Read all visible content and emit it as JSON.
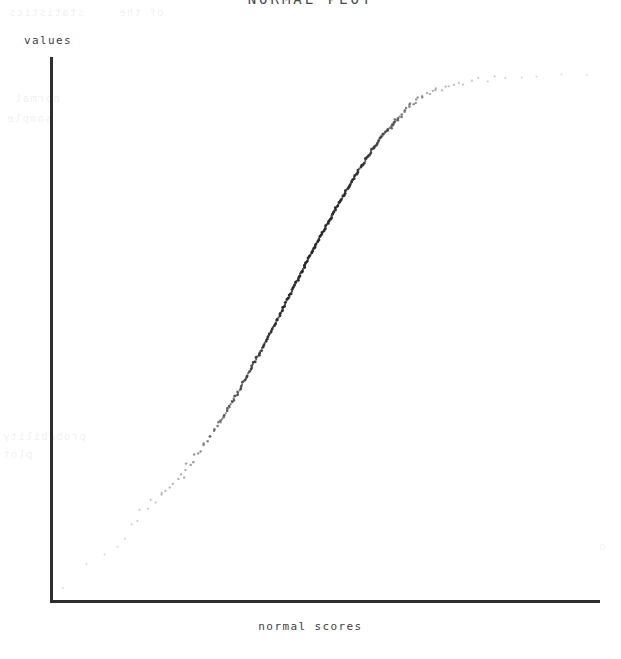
{
  "title": "NORMAL PLOT",
  "axes": {
    "y_label": "values",
    "x_label": "normal scores"
  },
  "ghost_text": [
    {
      "text": "statistics",
      "x": 8,
      "y": 6
    },
    {
      "text": "of the",
      "x": 118,
      "y": 6
    },
    {
      "text": "normal",
      "x": 14,
      "y": 92
    },
    {
      "text": "sample",
      "x": 6,
      "y": 112
    },
    {
      "text": "probability",
      "x": 2,
      "y": 430
    },
    {
      "text": "plot",
      "x": 2,
      "y": 448
    },
    {
      "text": "o",
      "x": 598,
      "y": 540
    }
  ],
  "chart_data": {
    "type": "scatter",
    "title": "NORMAL PLOT",
    "xlabel": "normal scores",
    "ylabel": "values",
    "grid": false,
    "legend": null,
    "axis_style": "L-shaped spines, no tick marks, no tick labels",
    "xlim": [
      -3,
      3
    ],
    "ylim": [
      0,
      1
    ],
    "n_points": 200,
    "x": [
      -2.88,
      -2.62,
      -2.41,
      -2.3,
      -2.2,
      -2.14,
      -2.07,
      -2.02,
      -1.96,
      -1.91,
      -1.86,
      -1.82,
      -1.78,
      -1.74,
      -1.7,
      -1.66,
      -1.63,
      -1.6,
      -1.57,
      -1.54,
      -1.51,
      -1.48,
      -1.45,
      -1.42,
      -1.4,
      -1.37,
      -1.35,
      -1.32,
      -1.3,
      -1.27,
      -1.25,
      -1.23,
      -1.21,
      -1.19,
      -1.16,
      -1.14,
      -1.12,
      -1.1,
      -1.08,
      -1.06,
      -1.04,
      -1.03,
      -1.01,
      -0.99,
      -0.97,
      -0.95,
      -0.93,
      -0.92,
      -0.9,
      -0.88,
      -0.86,
      -0.85,
      -0.83,
      -0.81,
      -0.8,
      -0.78,
      -0.76,
      -0.75,
      -0.73,
      -0.72,
      -0.7,
      -0.68,
      -0.67,
      -0.65,
      -0.64,
      -0.62,
      -0.61,
      -0.59,
      -0.58,
      -0.56,
      -0.55,
      -0.53,
      -0.52,
      -0.5,
      -0.49,
      -0.47,
      -0.46,
      -0.45,
      -0.43,
      -0.42,
      -0.4,
      -0.39,
      -0.37,
      -0.36,
      -0.35,
      -0.33,
      -0.32,
      -0.3,
      -0.29,
      -0.28,
      -0.26,
      -0.25,
      -0.23,
      -0.22,
      -0.21,
      -0.19,
      -0.18,
      -0.17,
      -0.15,
      -0.14,
      -0.12,
      -0.11,
      -0.1,
      -0.08,
      -0.07,
      -0.06,
      -0.04,
      -0.03,
      -0.01,
      0.0,
      0.01,
      0.03,
      0.04,
      0.06,
      0.07,
      0.08,
      0.1,
      0.11,
      0.12,
      0.14,
      0.15,
      0.17,
      0.18,
      0.19,
      0.21,
      0.22,
      0.23,
      0.25,
      0.26,
      0.28,
      0.29,
      0.3,
      0.32,
      0.33,
      0.35,
      0.36,
      0.37,
      0.39,
      0.4,
      0.42,
      0.43,
      0.45,
      0.46,
      0.47,
      0.49,
      0.5,
      0.52,
      0.53,
      0.55,
      0.56,
      0.58,
      0.59,
      0.61,
      0.62,
      0.64,
      0.65,
      0.67,
      0.68,
      0.7,
      0.72,
      0.73,
      0.75,
      0.76,
      0.78,
      0.8,
      0.81,
      0.83,
      0.85,
      0.86,
      0.88,
      0.9,
      0.92,
      0.93,
      0.95,
      0.97,
      0.99,
      1.01,
      1.03,
      1.06,
      1.08,
      1.1,
      1.14,
      1.17,
      1.2,
      1.24,
      1.28,
      1.32,
      1.37,
      1.42,
      1.48,
      1.54,
      1.61,
      1.69,
      1.78,
      1.88,
      2.0,
      2.15,
      2.35,
      2.6,
      2.9
    ],
    "y": [
      0.028,
      0.07,
      0.082,
      0.104,
      0.119,
      0.144,
      0.151,
      0.163,
      0.168,
      0.183,
      0.183,
      0.197,
      0.194,
      0.207,
      0.213,
      0.219,
      0.222,
      0.234,
      0.231,
      0.243,
      0.25,
      0.253,
      0.259,
      0.268,
      0.271,
      0.278,
      0.287,
      0.29,
      0.296,
      0.302,
      0.305,
      0.314,
      0.317,
      0.323,
      0.329,
      0.332,
      0.341,
      0.344,
      0.351,
      0.356,
      0.359,
      0.368,
      0.371,
      0.378,
      0.381,
      0.387,
      0.393,
      0.396,
      0.405,
      0.408,
      0.414,
      0.417,
      0.426,
      0.429,
      0.435,
      0.441,
      0.444,
      0.45,
      0.456,
      0.459,
      0.465,
      0.471,
      0.474,
      0.48,
      0.486,
      0.489,
      0.495,
      0.498,
      0.504,
      0.51,
      0.513,
      0.519,
      0.522,
      0.528,
      0.534,
      0.537,
      0.543,
      0.546,
      0.552,
      0.558,
      0.561,
      0.567,
      0.57,
      0.576,
      0.582,
      0.585,
      0.591,
      0.594,
      0.6,
      0.603,
      0.609,
      0.612,
      0.618,
      0.621,
      0.627,
      0.63,
      0.636,
      0.639,
      0.645,
      0.648,
      0.654,
      0.657,
      0.66,
      0.666,
      0.669,
      0.675,
      0.678,
      0.684,
      0.687,
      0.69,
      0.696,
      0.699,
      0.705,
      0.708,
      0.711,
      0.717,
      0.72,
      0.726,
      0.729,
      0.732,
      0.738,
      0.741,
      0.744,
      0.75,
      0.753,
      0.756,
      0.762,
      0.765,
      0.768,
      0.771,
      0.777,
      0.78,
      0.783,
      0.789,
      0.792,
      0.795,
      0.798,
      0.804,
      0.807,
      0.81,
      0.813,
      0.819,
      0.822,
      0.825,
      0.828,
      0.831,
      0.837,
      0.84,
      0.843,
      0.846,
      0.849,
      0.852,
      0.858,
      0.861,
      0.864,
      0.867,
      0.87,
      0.873,
      0.876,
      0.879,
      0.882,
      0.885,
      0.888,
      0.891,
      0.894,
      0.897,
      0.9,
      0.903,
      0.906,
      0.909,
      0.912,
      0.915,
      0.918,
      0.921,
      0.923,
      0.926,
      0.929,
      0.932,
      0.934,
      0.937,
      0.939,
      0.942,
      0.944,
      0.947,
      0.949,
      0.951,
      0.954,
      0.956,
      0.958,
      0.96,
      0.962,
      0.964,
      0.966,
      0.968,
      0.97,
      0.972,
      0.974,
      0.976,
      0.978,
      0.98
    ]
  }
}
